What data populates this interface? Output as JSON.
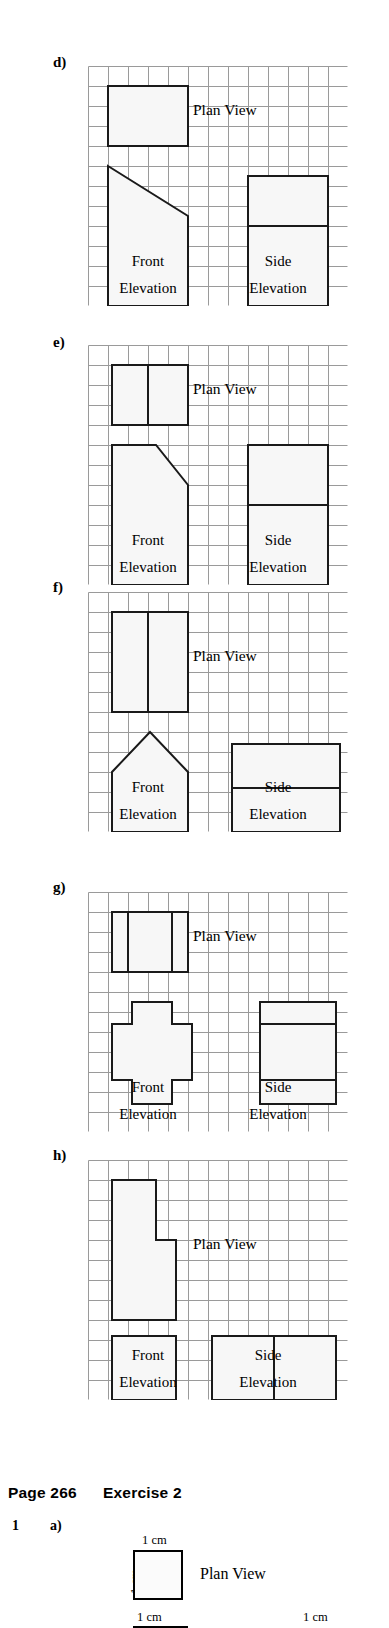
{
  "meta": {
    "grid": {
      "cols": 13,
      "rows": 12,
      "cell": 20,
      "line_color": "#9a9a9a",
      "shape_stroke": "#1a1a1a",
      "shape_fill": "#f7f7f7"
    },
    "labels": {
      "plan_view": "Plan View",
      "front": "Front",
      "elevation": "Elevation",
      "side": "Side"
    }
  },
  "panels": [
    {
      "id": "d",
      "letter": "d)",
      "top": 55,
      "grid_left": 88,
      "grid_top": 66,
      "plan_view_label": "Plan View",
      "front_label": "Front",
      "front_sub": "Elevation",
      "side_label": "Side",
      "side_sub": "Elevation",
      "plan_view_text_cell": {
        "col": 5.25,
        "row": 2.45
      },
      "front_text_cell": {
        "col": 3.0,
        "row": 10.0
      },
      "front_sub_cell": {
        "col": 3.0,
        "row": 11.35
      },
      "side_text_cell": {
        "col": 9.5,
        "row": 10.0
      },
      "side_sub_cell": {
        "col": 9.5,
        "row": 11.35
      },
      "shapes": [
        {
          "name": "plan-view-rect",
          "kind": "poly",
          "points": "1,1 5,1 5,4 1,4"
        },
        {
          "name": "front-elevation-trapezoid",
          "kind": "poly",
          "points": "1,5 5,7.5 5,12 1,12"
        },
        {
          "name": "side-elevation-rect",
          "kind": "poly",
          "points": "8,5.5 12,5.5 12,12 8,12"
        },
        {
          "name": "side-elevation-divider",
          "kind": "line",
          "points": "8,8 12,8"
        }
      ]
    },
    {
      "id": "e",
      "letter": "e)",
      "top": 335,
      "grid_left": 88,
      "grid_top": 345,
      "plan_view_label": "Plan View",
      "front_label": "Front",
      "front_sub": "Elevation",
      "side_label": "Side",
      "side_sub": "Elevation",
      "plan_view_text_cell": {
        "col": 5.25,
        "row": 2.45
      },
      "front_text_cell": {
        "col": 3.0,
        "row": 10.0
      },
      "front_sub_cell": {
        "col": 3.0,
        "row": 11.35
      },
      "side_text_cell": {
        "col": 9.5,
        "row": 10.0
      },
      "side_sub_cell": {
        "col": 9.5,
        "row": 11.35
      },
      "shapes": [
        {
          "name": "plan-view-rect",
          "kind": "poly",
          "points": "1.2,1 5,1 5,4 1.2,4"
        },
        {
          "name": "plan-view-divider",
          "kind": "line",
          "points": "3,1 3,4"
        },
        {
          "name": "front-elevation-chamfered",
          "kind": "poly",
          "points": "1.2,5 3.4,5 5,7 5,12 1.2,12"
        },
        {
          "name": "side-elevation-rect",
          "kind": "poly",
          "points": "8,5 12,5 12,12 8,12"
        },
        {
          "name": "side-elevation-divider",
          "kind": "line",
          "points": "8,8 12,8"
        }
      ]
    },
    {
      "id": "f",
      "letter": "f)",
      "top": 580,
      "grid_left": 88,
      "grid_top": 592,
      "plan_view_label": "Plan View",
      "front_label": "Front",
      "front_sub": "Elevation",
      "side_label": "Side",
      "side_sub": "Elevation",
      "plan_view_text_cell": {
        "col": 5.25,
        "row": 3.45
      },
      "front_text_cell": {
        "col": 3.0,
        "row": 10.0
      },
      "front_sub_cell": {
        "col": 3.0,
        "row": 11.35
      },
      "side_text_cell": {
        "col": 9.5,
        "row": 10.0
      },
      "side_sub_cell": {
        "col": 9.5,
        "row": 11.35
      },
      "shapes": [
        {
          "name": "plan-view-rect",
          "kind": "poly",
          "points": "1.2,1 5,1 5,6 1.2,6"
        },
        {
          "name": "plan-view-divider",
          "kind": "line",
          "points": "3,1 3,6"
        },
        {
          "name": "front-elevation-house",
          "kind": "poly",
          "points": "3.1,7 5,9 5,12 1.2,12 1.2,9"
        },
        {
          "name": "side-elevation-rect",
          "kind": "poly",
          "points": "7.2,7.6 12.6,7.6 12.6,12 7.2,12"
        },
        {
          "name": "side-elevation-divider",
          "kind": "line",
          "points": "7.2,9.8 12.6,9.8"
        }
      ]
    },
    {
      "id": "g",
      "letter": "g)",
      "top": 880,
      "grid_left": 88,
      "grid_top": 892,
      "plan_view_label": "Plan View",
      "front_label": "Front",
      "front_sub": "Elevation",
      "side_label": "Side",
      "side_sub": "Elevation",
      "plan_view_text_cell": {
        "col": 5.25,
        "row": 2.45
      },
      "front_text_cell": {
        "col": 3.0,
        "row": 10.0
      },
      "front_sub_cell": {
        "col": 3.0,
        "row": 11.35
      },
      "side_text_cell": {
        "col": 9.5,
        "row": 10.0
      },
      "side_sub_cell": {
        "col": 9.5,
        "row": 11.35
      },
      "shapes": [
        {
          "name": "plan-view-rect",
          "kind": "poly",
          "points": "1.2,1 5,1 5,4 1.2,4"
        },
        {
          "name": "plan-view-divider-left",
          "kind": "line",
          "points": "2,1 2,4"
        },
        {
          "name": "plan-view-divider-right",
          "kind": "line",
          "points": "4.2,1 4.2,4"
        },
        {
          "name": "front-elevation-cross",
          "kind": "poly",
          "points": "2.2,5.5 4.2,5.5 4.2,6.6 5.2,6.6 5.2,9.4 4.2,9.4 4.2,10.6 2.2,10.6 2.2,9.4 1.2,9.4 1.2,6.6 2.2,6.6"
        },
        {
          "name": "side-elevation-rect",
          "kind": "poly",
          "points": "8.6,5.5 12.4,5.5 12.4,10.6 8.6,10.6"
        },
        {
          "name": "side-elevation-divider",
          "kind": "line",
          "points": "8.6,6.6 12.4,6.6"
        },
        {
          "name": "side-elevation-divider-2",
          "kind": "line",
          "points": "8.6,9.4 12.4,9.4"
        }
      ]
    },
    {
      "id": "h",
      "letter": "h)",
      "top": 1148,
      "grid_left": 88,
      "grid_top": 1160,
      "plan_view_label": "Plan View",
      "front_label": "Front",
      "front_sub": "Elevation",
      "side_label": "Side",
      "side_sub": "Elevation",
      "plan_view_text_cell": {
        "col": 5.25,
        "row": 4.45
      },
      "front_text_cell": {
        "col": 3.0,
        "row": 10.0
      },
      "front_sub_cell": {
        "col": 3.0,
        "row": 11.35
      },
      "side_text_cell": {
        "col": 9.0,
        "row": 10.0
      },
      "side_sub_cell": {
        "col": 9.0,
        "row": 11.35
      },
      "shapes": [
        {
          "name": "plan-view-lshape",
          "kind": "poly",
          "points": "1.2,1 3.4,1 3.4,4 4.4,4 4.4,8 1.2,8"
        },
        {
          "name": "front-elevation-rect",
          "kind": "poly",
          "points": "1.2,8.8 4.4,8.8 4.4,12 1.2,12"
        },
        {
          "name": "side-elevation-rect",
          "kind": "poly",
          "points": "6.2,8.8 12.4,8.8 12.4,12 6.2,12"
        },
        {
          "name": "side-elevation-divider",
          "kind": "line",
          "points": "9.3,8.8 9.3,12"
        }
      ]
    }
  ],
  "exercise": {
    "heading_page": "Page 266",
    "heading_exercise": "Exercise 2",
    "question_number": "1",
    "question_letter": "a)",
    "plan_view_label": "Plan View",
    "dim_top": "1 cm",
    "dim_left": "1 cm",
    "dim_bottom_left": "1 cm",
    "dim_bottom_right": "1 cm"
  }
}
